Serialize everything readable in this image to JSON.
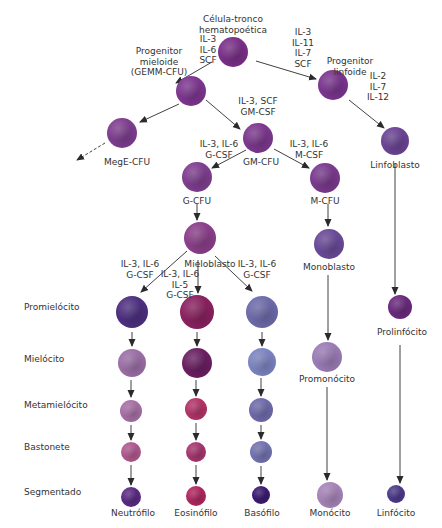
{
  "nodes": [
    {
      "id": "hsc",
      "label": "Célula-tronco\nhematopoética",
      "x": 233,
      "y": 52,
      "r": 15,
      "color": "#7a2f88",
      "lx": 233,
      "ly": 14
    },
    {
      "id": "cmp",
      "label": "Progenitor\nmieloide\n(GEMM-CFU)",
      "x": 191,
      "y": 91,
      "r": 15,
      "color": "#7d3690",
      "lx": 159,
      "ly": 46
    },
    {
      "id": "clp",
      "label": "Progenitor\nlinfoide",
      "x": 333,
      "y": 85,
      "r": 15,
      "color": "#7b3590",
      "lx": 350,
      "ly": 56
    },
    {
      "id": "mege",
      "label": "MegE-CFU",
      "x": 122,
      "y": 133,
      "r": 15,
      "color": "#7e3d8f",
      "lx": 127,
      "ly": 157
    },
    {
      "id": "gm",
      "label": "GM-CFU",
      "x": 258,
      "y": 138,
      "r": 15,
      "color": "#7c388e",
      "lx": 261,
      "ly": 157
    },
    {
      "id": "lymphoblast",
      "label": "Linfoblasto",
      "x": 395,
      "y": 141,
      "r": 14,
      "color": "#6b4493",
      "lx": 395,
      "ly": 160
    },
    {
      "id": "gcfu",
      "label": "G-CFU",
      "x": 197,
      "y": 177,
      "r": 15,
      "color": "#7f3e8f",
      "lx": 197,
      "ly": 196
    },
    {
      "id": "mcfu",
      "label": "M-CFU",
      "x": 325,
      "y": 178,
      "r": 15,
      "color": "#7a3a8e",
      "lx": 325,
      "ly": 196
    },
    {
      "id": "myeloblast",
      "label": "Mieloblasto",
      "x": 200,
      "y": 238,
      "r": 16,
      "color": "#8a3f8a",
      "lx": 210,
      "ly": 259
    },
    {
      "id": "monoblast",
      "label": "Monoblasto",
      "x": 329,
      "y": 244,
      "r": 15,
      "color": "#6a4a98",
      "lx": 329,
      "ly": 262
    },
    {
      "id": "promono",
      "label": "Promonócito",
      "x": 327,
      "y": 357,
      "r": 15,
      "color": "#9a7cb6",
      "lx": 327,
      "ly": 374
    },
    {
      "id": "prolymph",
      "label": "Prolinfócito",
      "x": 400,
      "y": 307,
      "r": 12,
      "color": "#6a2a7e",
      "lx": 402,
      "ly": 327
    },
    {
      "id": "n1",
      "label": "",
      "x": 132,
      "y": 312,
      "r": 16,
      "color": "#4d2f80",
      "lx": 0,
      "ly": 0
    },
    {
      "id": "e1",
      "label": "",
      "x": 197,
      "y": 312,
      "r": 17,
      "color": "#8a2160",
      "lx": 0,
      "ly": 0
    },
    {
      "id": "b1",
      "label": "",
      "x": 262,
      "y": 312,
      "r": 16,
      "color": "#6d6aaa",
      "lx": 0,
      "ly": 0
    },
    {
      "id": "n2",
      "label": "",
      "x": 132,
      "y": 363,
      "r": 14,
      "color": "#9b6fa6",
      "lx": 0,
      "ly": 0
    },
    {
      "id": "e2",
      "label": "",
      "x": 197,
      "y": 363,
      "r": 15,
      "color": "#6a1f62",
      "lx": 0,
      "ly": 0
    },
    {
      "id": "b2",
      "label": "",
      "x": 262,
      "y": 362,
      "r": 14,
      "color": "#7b84c0",
      "lx": 0,
      "ly": 0
    },
    {
      "id": "n3",
      "label": "",
      "x": 131,
      "y": 411,
      "r": 11,
      "color": "#a66fa5",
      "lx": 0,
      "ly": 0
    },
    {
      "id": "e3",
      "label": "",
      "x": 196,
      "y": 409,
      "r": 11,
      "color": "#b23468",
      "lx": 0,
      "ly": 0
    },
    {
      "id": "b3",
      "label": "",
      "x": 261,
      "y": 410,
      "r": 12,
      "color": "#6e6aab",
      "lx": 0,
      "ly": 0
    },
    {
      "id": "n4",
      "label": "",
      "x": 131,
      "y": 452,
      "r": 10,
      "color": "#b0588d",
      "lx": 0,
      "ly": 0
    },
    {
      "id": "e4",
      "label": "",
      "x": 196,
      "y": 452,
      "r": 10,
      "color": "#a53670",
      "lx": 0,
      "ly": 0
    },
    {
      "id": "b4",
      "label": "",
      "x": 261,
      "y": 452,
      "r": 11,
      "color": "#7272b0",
      "lx": 0,
      "ly": 0
    },
    {
      "id": "neutrophil",
      "label": "Neutrófilo",
      "x": 131,
      "y": 497,
      "r": 10,
      "color": "#5a2a84",
      "lx": 133,
      "ly": 508
    },
    {
      "id": "eosinophil",
      "label": "Eosinófilo",
      "x": 196,
      "y": 496,
      "r": 10,
      "color": "#b0265f",
      "lx": 196,
      "ly": 508
    },
    {
      "id": "basophil",
      "label": "Basófilo",
      "x": 261,
      "y": 495,
      "r": 9,
      "color": "#3a1a70",
      "lx": 262,
      "ly": 508
    },
    {
      "id": "monocyte",
      "label": "Monócito",
      "x": 330,
      "y": 495,
      "r": 13,
      "color": "#a683b8",
      "lx": 330,
      "ly": 508
    },
    {
      "id": "lymphocyte",
      "label": "Linfócito",
      "x": 396,
      "y": 494,
      "r": 9,
      "color": "#4d3a8a",
      "lx": 396,
      "ly": 508
    }
  ],
  "edges": [
    {
      "from": [
        212,
        62
      ],
      "to": [
        176,
        83
      ],
      "dashed": false
    },
    {
      "from": [
        256,
        61
      ],
      "to": [
        316,
        79
      ],
      "dashed": false
    },
    {
      "from": [
        179,
        104
      ],
      "to": [
        140,
        122
      ],
      "dashed": false
    },
    {
      "from": [
        206,
        100
      ],
      "to": [
        240,
        129
      ],
      "dashed": false
    },
    {
      "from": [
        349,
        100
      ],
      "to": [
        384,
        128
      ],
      "dashed": false
    },
    {
      "from": [
        105,
        143
      ],
      "to": [
        77,
        160
      ],
      "dashed": true
    },
    {
      "from": [
        246,
        150
      ],
      "to": [
        212,
        168
      ],
      "dashed": false
    },
    {
      "from": [
        274,
        149
      ],
      "to": [
        309,
        168
      ],
      "dashed": false
    },
    {
      "from": [
        395,
        164
      ],
      "to": [
        395,
        294
      ],
      "dashed": false
    },
    {
      "from": [
        197,
        204
      ],
      "to": [
        197,
        220
      ],
      "dashed": false
    },
    {
      "from": [
        328,
        204
      ],
      "to": [
        328,
        226
      ],
      "dashed": false
    },
    {
      "from": [
        187,
        251
      ],
      "to": [
        141,
        292
      ],
      "dashed": false
    },
    {
      "from": [
        198,
        260
      ],
      "to": [
        198,
        293
      ],
      "dashed": false
    },
    {
      "from": [
        215,
        256
      ],
      "to": [
        252,
        291
      ],
      "dashed": false
    },
    {
      "from": [
        328,
        275
      ],
      "to": [
        328,
        340
      ],
      "dashed": false
    },
    {
      "from": [
        327,
        387
      ],
      "to": [
        327,
        480
      ],
      "dashed": false
    },
    {
      "from": [
        400,
        345
      ],
      "to": [
        400,
        483
      ],
      "dashed": false
    },
    {
      "from": [
        132,
        332
      ],
      "to": [
        132,
        346
      ],
      "dashed": false
    },
    {
      "from": [
        197,
        332
      ],
      "to": [
        197,
        346
      ],
      "dashed": false
    },
    {
      "from": [
        262,
        332
      ],
      "to": [
        262,
        346
      ],
      "dashed": false
    },
    {
      "from": [
        131,
        380
      ],
      "to": [
        131,
        397
      ],
      "dashed": false
    },
    {
      "from": [
        196,
        380
      ],
      "to": [
        196,
        396
      ],
      "dashed": false
    },
    {
      "from": [
        261,
        378
      ],
      "to": [
        261,
        396
      ],
      "dashed": false
    },
    {
      "from": [
        131,
        425
      ],
      "to": [
        131,
        440
      ],
      "dashed": false
    },
    {
      "from": [
        196,
        423
      ],
      "to": [
        196,
        440
      ],
      "dashed": false
    },
    {
      "from": [
        261,
        425
      ],
      "to": [
        261,
        439
      ],
      "dashed": false
    },
    {
      "from": [
        131,
        465
      ],
      "to": [
        131,
        485
      ],
      "dashed": false
    },
    {
      "from": [
        196,
        465
      ],
      "to": [
        196,
        484
      ],
      "dashed": false
    },
    {
      "from": [
        261,
        466
      ],
      "to": [
        261,
        484
      ],
      "dashed": false
    }
  ],
  "cytokines": [
    {
      "id": "to-cmp",
      "text": "IL-3\nIL-6\nSCF",
      "x": 208,
      "y": 34
    },
    {
      "id": "to-clp",
      "text": "IL-3\nIL-11\nIL-7\nSCF",
      "x": 303,
      "y": 27
    },
    {
      "id": "to-lymphoblast",
      "text": "IL-2\nIL-7\nIL-12",
      "x": 378,
      "y": 71
    },
    {
      "id": "to-gm",
      "text": "IL-3, SCF\nGM-CSF",
      "x": 258,
      "y": 96
    },
    {
      "id": "to-gcfu",
      "text": "IL-3, IL-6\nG-CSF",
      "x": 219,
      "y": 139
    },
    {
      "id": "to-mcfu",
      "text": "IL-3, IL-6\nM-CSF",
      "x": 309,
      "y": 139
    },
    {
      "id": "to-neutro",
      "text": "IL-3, IL-6\nG-CSF",
      "x": 140,
      "y": 259
    },
    {
      "id": "to-eos",
      "text": "IL-3, IL-6\nIL-5\nG-CSF",
      "x": 180,
      "y": 269
    },
    {
      "id": "to-baso",
      "text": "IL-3, IL-6\nG-CSF",
      "x": 257,
      "y": 259
    }
  ],
  "stages": [
    {
      "label": "Promielócito",
      "y": 307
    },
    {
      "label": "Mielócito",
      "y": 359
    },
    {
      "label": "Metamielócito",
      "y": 405
    },
    {
      "label": "Bastonete",
      "y": 447
    },
    {
      "label": "Segmentado",
      "y": 492
    }
  ],
  "colors": {
    "arrow": "#2b2b2b",
    "text": "#333333",
    "background": "#ffffff"
  }
}
